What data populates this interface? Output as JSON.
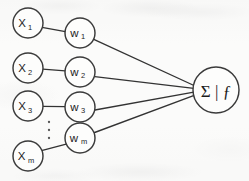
{
  "diagram": {
    "style": {
      "background_color": "#fbfbfa",
      "stroke_color": "#333333",
      "node_fill": "#fdfdfc",
      "text_color": "#1c1c1c"
    },
    "input_nodes": [
      {
        "name": "input-node-x1",
        "base": "X",
        "subscript": "1",
        "label": "X1",
        "cx": 28,
        "cy": 23,
        "r": 15
      },
      {
        "name": "input-node-x2",
        "base": "X",
        "subscript": "2",
        "label": "X2",
        "cx": 28,
        "cy": 68,
        "r": 15
      },
      {
        "name": "input-node-x3",
        "base": "X",
        "subscript": "3",
        "label": "X3",
        "cx": 28,
        "cy": 106,
        "r": 15
      },
      {
        "name": "input-node-xm",
        "base": "X",
        "subscript": "m",
        "label": "Xm",
        "cx": 28,
        "cy": 156,
        "r": 15
      }
    ],
    "weight_nodes": [
      {
        "name": "weight-node-w1",
        "base": "w",
        "subscript": "1",
        "label": "w1",
        "cx": 80,
        "cy": 33,
        "r": 15
      },
      {
        "name": "weight-node-w2",
        "base": "w",
        "subscript": "2",
        "label": "w2",
        "cx": 80,
        "cy": 72,
        "r": 15
      },
      {
        "name": "weight-node-w3",
        "base": "w",
        "subscript": "3",
        "label": "w3",
        "cx": 80,
        "cy": 107,
        "r": 15
      },
      {
        "name": "weight-node-wm",
        "base": "w",
        "subscript": "m",
        "label": "wm",
        "cx": 80,
        "cy": 138,
        "r": 15
      }
    ],
    "output_node": {
      "name": "output-node-summation",
      "label": "Σ | ƒ",
      "sigma": "Σ",
      "bar": "|",
      "activation": "ƒ",
      "cx": 216,
      "cy": 90,
      "r": 23
    },
    "ellipsis": {
      "label": "vertical-ellipsis",
      "dots": 3,
      "cx": 49,
      "cy_start": 122,
      "spacing": 8
    },
    "edges": [
      {
        "name": "edge-x1-w1",
        "from": "X1",
        "to": "w1"
      },
      {
        "name": "edge-x2-w2",
        "from": "X2",
        "to": "w2"
      },
      {
        "name": "edge-x3-w3",
        "from": "X3",
        "to": "w3"
      },
      {
        "name": "edge-xm-wm",
        "from": "Xm",
        "to": "wm"
      },
      {
        "name": "edge-w1-sum",
        "from": "w1",
        "to": "sum"
      },
      {
        "name": "edge-w2-sum",
        "from": "w2",
        "to": "sum"
      },
      {
        "name": "edge-w3-sum",
        "from": "w3",
        "to": "sum"
      },
      {
        "name": "edge-wm-sum",
        "from": "wm",
        "to": "sum"
      }
    ]
  }
}
